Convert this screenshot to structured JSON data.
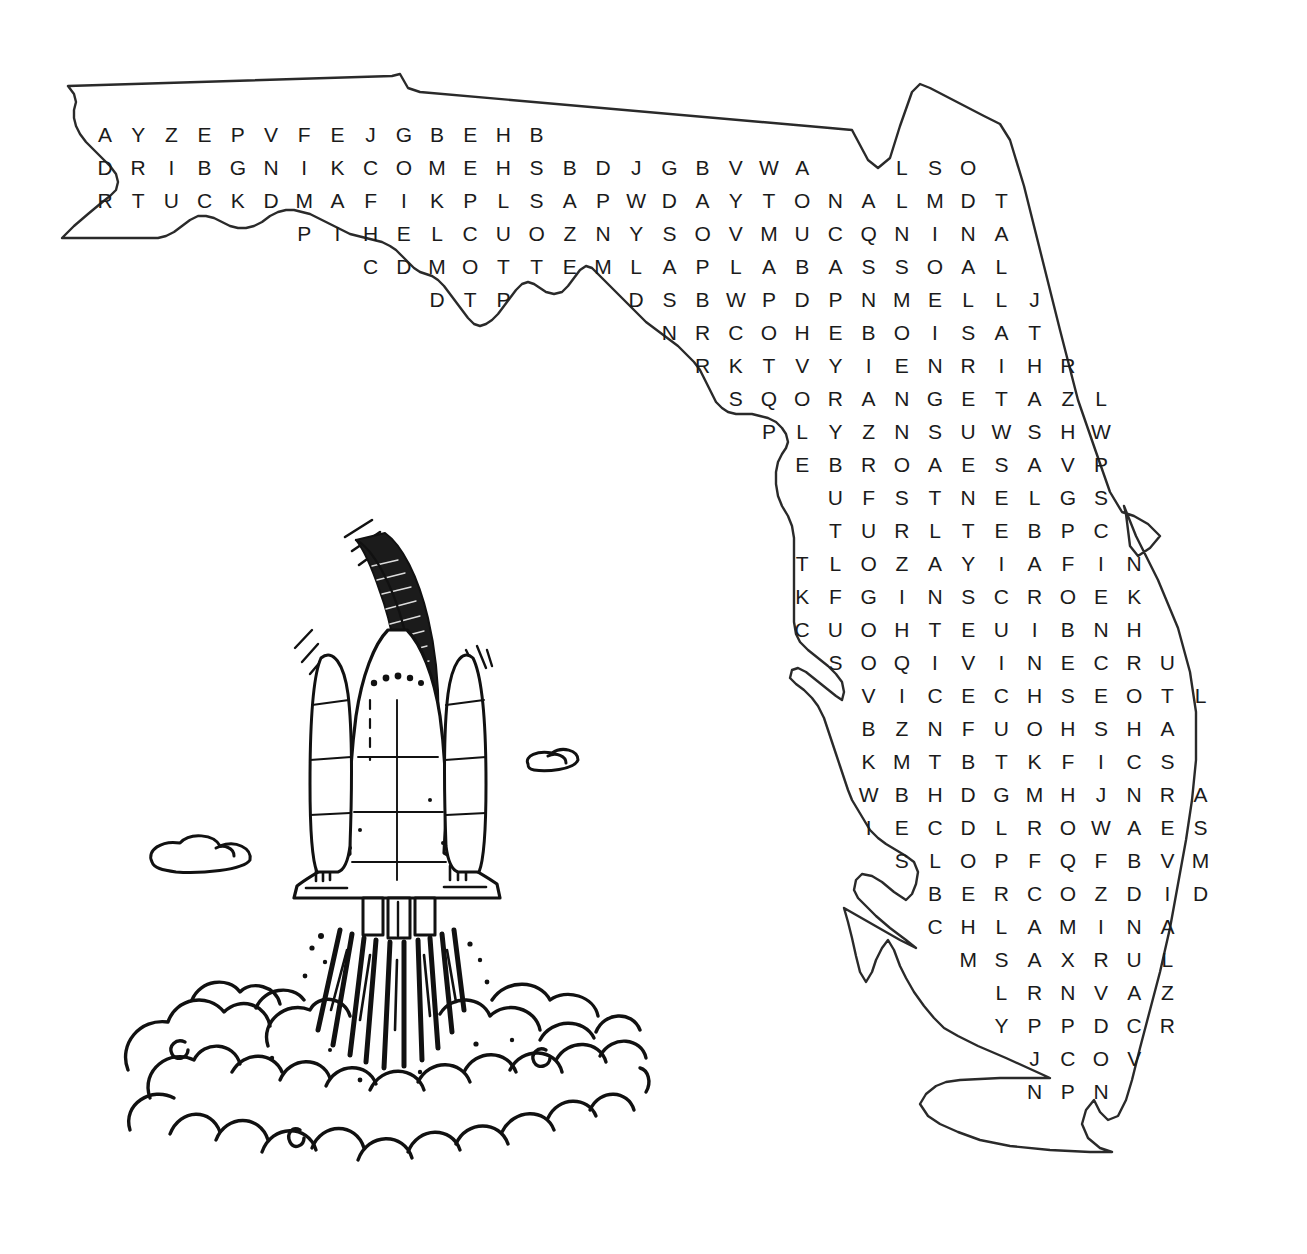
{
  "puzzle": {
    "title": "Florida Word Search",
    "theme": "Space Shuttle Launch over Florida",
    "grid_origin": {
      "x": 105,
      "y": 112
    },
    "cell_width": 33.2,
    "cell_height": 33.0,
    "rows": [
      {
        "start_col": 0,
        "letters": "AYZEPVFEJGBEHB"
      },
      {
        "start_col": 0,
        "letters": "DRIBGNIKCOMEHSBDJGBVWA"
      },
      {
        "start_col": 24,
        "letters": "LSO"
      },
      {
        "start_col": 0,
        "letters": "RTUCKDMAFIKPLSAPWDAYTONALMDT"
      },
      {
        "start_col": 6,
        "letters": "PIHELCUOZNYSOVMUCQNINA"
      },
      {
        "start_col": 8,
        "letters": "CDMOTTEMLAPLABASSOAL"
      },
      {
        "start_col": 10,
        "letters": "DTP"
      },
      {
        "start_col": 16,
        "letters": "DSBWPDPNMELLJ"
      },
      {
        "start_col": 17,
        "letters": "NRCOHEBOISAT"
      },
      {
        "start_col": 18,
        "letters": "RKTVYIENRIHR"
      },
      {
        "start_col": 19,
        "letters": "SQORANGETAZL"
      },
      {
        "start_col": 20,
        "letters": "PLYZNSUWSHW"
      },
      {
        "start_col": 21,
        "letters": "EBROAESAVP"
      },
      {
        "start_col": 22,
        "letters": "UFSTNELGS"
      },
      {
        "start_col": 22,
        "letters": "TURLTEBPC"
      },
      {
        "start_col": 21,
        "letters": "TLOZAYIAFIN"
      },
      {
        "start_col": 21,
        "letters": "KFGINSCROEK"
      },
      {
        "start_col": 21,
        "letters": "CUOHTEUIBNH"
      },
      {
        "start_col": 22,
        "letters": "SOQIVINECRU"
      },
      {
        "start_col": 23,
        "letters": "VICECHSEOTL"
      },
      {
        "start_col": 23,
        "letters": "BZNFUOHSHA"
      },
      {
        "start_col": 23,
        "letters": "KMTBTKFICS"
      },
      {
        "start_col": 23,
        "letters": "WBHDGMHJNRA"
      },
      {
        "start_col": 23,
        "letters": "IECDLROWAES"
      },
      {
        "start_col": 24,
        "letters": "SLOPFQFBVM"
      },
      {
        "start_col": 25,
        "letters": "BERCOZDID"
      },
      {
        "start_col": 25,
        "letters": "CHLAMINA"
      },
      {
        "start_col": 26,
        "letters": "MSAXRUL"
      },
      {
        "start_col": 27,
        "letters": "LRNVAZ"
      },
      {
        "start_col": 27,
        "letters": "YPPDCR"
      },
      {
        "start_col": 28,
        "letters": "JCOV"
      },
      {
        "start_col": 28,
        "letters": "NPN"
      }
    ],
    "row_y": [
      124,
      157,
      157,
      190,
      223,
      256,
      289,
      289,
      322,
      355,
      388,
      421,
      454,
      487,
      520,
      553,
      586,
      619,
      652,
      685,
      718,
      751,
      784,
      817,
      850,
      883,
      916,
      949,
      982,
      1015,
      1048,
      1081
    ],
    "hidden_words_visible_in_grid": [
      "DAYTONA",
      "ORANGE",
      "BOCA",
      "MIAMI",
      "TAMPA"
    ],
    "colors": {
      "letter": "#1b1b1b",
      "outline": "#2a2a2a",
      "ink": "#111111",
      "background": "#ffffff"
    }
  },
  "illustration": {
    "name": "space-shuttle-launch",
    "parts": [
      "shuttle-orbiter",
      "external-tank",
      "solid-rocket-boosters",
      "exhaust-flames",
      "smoke-clouds",
      "motion-lines"
    ]
  },
  "map": {
    "name": "florida-state-outline",
    "regions": [
      "panhandle",
      "gulf-coast",
      "tampa-bay",
      "atlantic-coast",
      "everglades",
      "south-tip"
    ]
  }
}
